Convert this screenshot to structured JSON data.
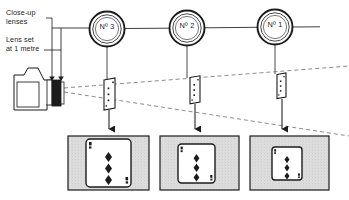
{
  "figure": {
    "type": "diagram",
    "background_color": "#ffffff",
    "line_color": "#1c1c1c",
    "frame_fill_color": "#d9d9d9",
    "card_fill_color": "#ffffff"
  },
  "annotations": {
    "closeup_lenses": "Close-up\nlenses",
    "lens_setting": "Lens set\nat 1 metre"
  },
  "lenses": [
    {
      "id": "lens-3",
      "label": "N",
      "sup": "o",
      "number": "3",
      "display": "Nº 3",
      "cx": 107,
      "cy": 29,
      "r_outer": 18,
      "r_inner": 14.5
    },
    {
      "id": "lens-2",
      "label": "N",
      "sup": "o",
      "number": "2",
      "display": "Nº 2",
      "cx": 187,
      "cy": 28,
      "r_outer": 18,
      "r_inner": 14.5
    },
    {
      "id": "lens-1",
      "label": "N",
      "sup": "o",
      "number": "1",
      "display": "Nº 1",
      "cx": 275,
      "cy": 27,
      "r_outer": 18,
      "r_inner": 14.5
    }
  ],
  "subjects": [
    {
      "id": "subject-card-3",
      "x": 104,
      "y": 79,
      "w": 12,
      "h": 30,
      "pips": 3
    },
    {
      "id": "subject-card-2",
      "x": 190,
      "y": 76,
      "w": 11,
      "h": 27,
      "pips": 3
    },
    {
      "id": "subject-card-1",
      "x": 277,
      "y": 73,
      "w": 10,
      "h": 25,
      "pips": 3
    }
  ],
  "photographs": [
    {
      "id": "photo-3",
      "frame": {
        "x": 68,
        "y": 136,
        "w": 80,
        "h": 54
      },
      "card": {
        "x": 86,
        "y": 140,
        "w": 44,
        "h": 47
      },
      "pips": 3,
      "index": "3",
      "suit": "diamond"
    },
    {
      "id": "photo-2",
      "frame": {
        "x": 160,
        "y": 136,
        "w": 78,
        "h": 54
      },
      "card": {
        "x": 178,
        "y": 145,
        "w": 36,
        "h": 39
      },
      "pips": 3,
      "index": "3",
      "suit": "diamond"
    },
    {
      "id": "photo-1",
      "frame": {
        "x": 250,
        "y": 136,
        "w": 78,
        "h": 54
      },
      "card": {
        "x": 272,
        "y": 148,
        "w": 29,
        "h": 33
      },
      "pips": 3,
      "index": "3",
      "suit": "diamond"
    }
  ],
  "camera": {
    "id": "camera-body",
    "x": 14,
    "y": 74,
    "w": 58,
    "h": 36,
    "lens_barrel": {
      "x": 52,
      "y": 78,
      "w": 9,
      "h": 28
    }
  }
}
